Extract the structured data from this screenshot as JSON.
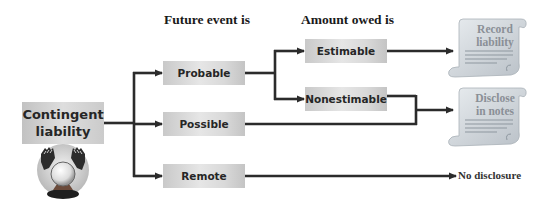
{
  "headers": {
    "future_event": "Future event is",
    "amount_owed": "Amount owed is"
  },
  "root": {
    "label_line1": "Contingent",
    "label_line2": "liability",
    "icon": "crystal-ball-icon"
  },
  "likelihood": [
    {
      "id": "probable",
      "label": "Probable"
    },
    {
      "id": "possible",
      "label": "Possible"
    },
    {
      "id": "remote",
      "label": "Remote"
    }
  ],
  "estimability": [
    {
      "id": "estimable",
      "label": "Estimable"
    },
    {
      "id": "nonestimable",
      "label": "Nonestimable"
    }
  ],
  "outcomes": {
    "record": {
      "line1": "Record",
      "line2": "liability",
      "icon": "scroll-icon"
    },
    "disclose": {
      "line1": "Disclose",
      "line2": "in notes",
      "icon": "scroll-icon"
    },
    "none": {
      "label": "No disclosure"
    }
  },
  "colors": {
    "line": "#2b2b2b",
    "box": "#d6d6d6",
    "scroll": "#d4d9de",
    "scroll_text": "#8a8f96"
  }
}
